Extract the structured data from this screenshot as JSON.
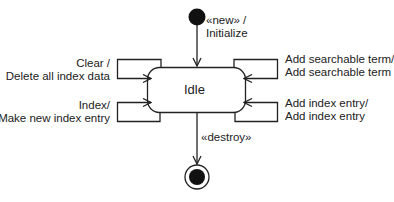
{
  "diagram": {
    "type": "uml-state-machine",
    "states": [
      {
        "id": "initial",
        "kind": "initial-pseudostate"
      },
      {
        "id": "idle",
        "kind": "state",
        "label": "Idle"
      },
      {
        "id": "final",
        "kind": "final-state"
      }
    ],
    "transitions": {
      "create": {
        "line1": "«new» /",
        "line2": "Initialize",
        "from": "initial",
        "to": "idle"
      },
      "clear": {
        "line1": "Clear /",
        "line2": "Delete all index data",
        "from": "idle",
        "to": "idle"
      },
      "index": {
        "line1": "Index/",
        "line2": "Make new index entry",
        "from": "idle",
        "to": "idle"
      },
      "add_term": {
        "line1": "Add searchable term/",
        "line2": "Add searchable term",
        "from": "idle",
        "to": "idle"
      },
      "add_entry": {
        "line1": "Add index entry/",
        "line2": "Add index entry",
        "from": "idle",
        "to": "idle"
      },
      "destroy": {
        "line1": "«destroy»",
        "from": "idle",
        "to": "final"
      }
    },
    "colors": {
      "stroke": "#222222",
      "fill": "#111111",
      "background": "#ffffff"
    }
  }
}
